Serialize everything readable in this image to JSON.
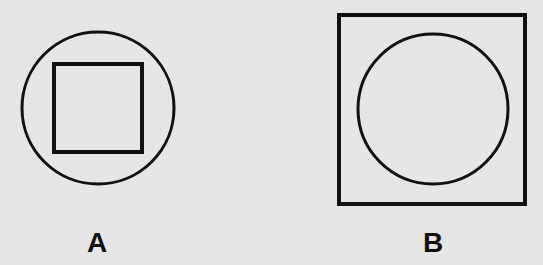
{
  "figures": [
    {
      "id": "A",
      "label": "A",
      "description": "Square inscribed in a circle",
      "outer_shape": {
        "type": "circle",
        "cx": 98,
        "cy": 108,
        "r": 76
      },
      "inner_shape": {
        "type": "square",
        "x": 54,
        "y": 64,
        "width": 88,
        "height": 88
      }
    },
    {
      "id": "B",
      "label": "B",
      "description": "Circle inscribed in a square",
      "outer_shape": {
        "type": "square",
        "x": 339,
        "y": 15,
        "width": 186,
        "height": 189
      },
      "inner_shape": {
        "type": "circle",
        "cx": 433,
        "cy": 109,
        "r": 75
      }
    }
  ],
  "colors": {
    "background": "#e6e6e6",
    "stroke": "#111111"
  }
}
